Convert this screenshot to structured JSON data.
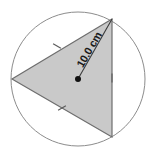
{
  "figure": {
    "background_color": "#ffffff",
    "circle": {
      "name": "circumscribed-circle",
      "center_x": 78,
      "center_y": 79,
      "radius_px": 67,
      "stroke_color": "#8c8c8c",
      "fill_color": "none",
      "stroke_width": 1
    },
    "triangle": {
      "name": "inscribed-equilateral-triangle",
      "fill_color": "#c9c9c9",
      "stroke_color": "#6e6e6e",
      "stroke_width": 1.2,
      "vertices": [
        {
          "label": "top-right-vertex",
          "x": 112,
          "y": 19
        },
        {
          "label": "left-vertex",
          "x": 12,
          "y": 79
        },
        {
          "label": "bottom-right-vertex",
          "x": 112,
          "y": 137
        }
      ]
    },
    "center_point": {
      "name": "circle-center-dot",
      "x": 78,
      "y": 79,
      "radius_px": 3,
      "color": "#111111"
    },
    "radius_segment": {
      "name": "radius-line",
      "from_x": 78,
      "from_y": 79,
      "to_x": 112,
      "to_y": 19,
      "stroke_color": "#3a3a3a",
      "stroke_width": 1.1,
      "label": "10.0 cm",
      "label_rotation_deg": -60,
      "label_x": 90,
      "label_y": 50
    },
    "tick_marks": [
      {
        "name": "tick-upper-left-side",
        "x": 57,
        "y": 46,
        "rotation_deg": 30
      },
      {
        "name": "tick-lower-left-side",
        "x": 62,
        "y": 108,
        "rotation_deg": -30
      },
      {
        "name": "tick-right-side",
        "x": 112,
        "y": 78,
        "rotation_deg": 90
      }
    ],
    "tick_style": {
      "length_px": 9,
      "stroke_color": "#5a5a5a",
      "stroke_width": 1.1
    }
  }
}
